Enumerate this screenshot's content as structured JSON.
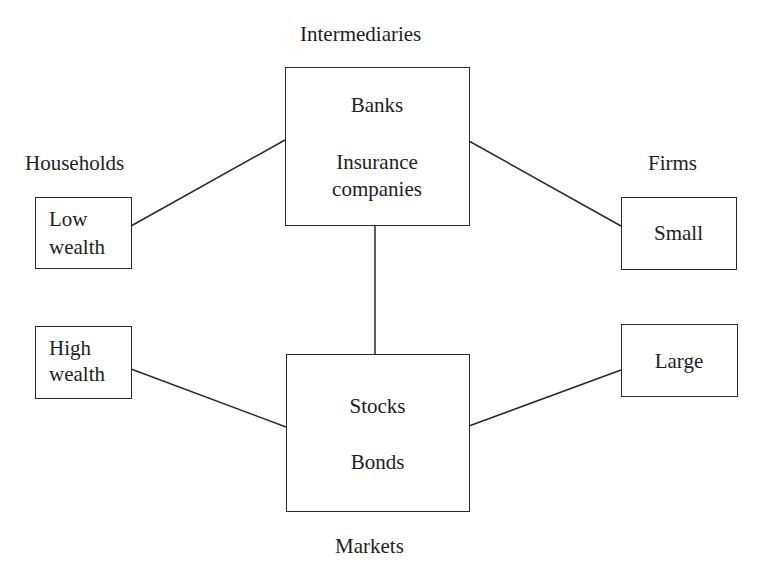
{
  "diagram": {
    "groups": {
      "intermediaries": {
        "title": "Intermediaries",
        "items": [
          "Banks",
          "Insurance",
          "companies"
        ]
      },
      "markets": {
        "title": "Markets",
        "items": [
          "Stocks",
          "Bonds"
        ]
      },
      "households": {
        "title": "Households",
        "low": [
          "Low",
          "wealth"
        ],
        "high": [
          "High",
          "wealth"
        ]
      },
      "firms": {
        "title": "Firms",
        "small": "Small",
        "large": "Large"
      }
    },
    "connections": [
      {
        "from": "Low wealth",
        "to": "Intermediaries"
      },
      {
        "from": "Intermediaries",
        "to": "Small"
      },
      {
        "from": "Intermediaries",
        "to": "Markets"
      },
      {
        "from": "High wealth",
        "to": "Markets"
      },
      {
        "from": "Markets",
        "to": "Large"
      }
    ],
    "line_color": "#2a2a2a"
  }
}
